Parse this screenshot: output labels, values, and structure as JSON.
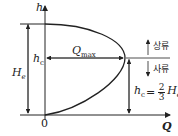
{
  "labels": {
    "h_axis": "h",
    "q_axis": "Q",
    "origin": "0",
    "hc_left": "h",
    "hc_left_sub": "c",
    "Hs": "H",
    "Hs_sub": "e",
    "qmax": "Q",
    "qmax_sub": "max",
    "upstream": "상류",
    "downstream": "사류",
    "formula_lhs": "h",
    "formula_lhs_sub": "c",
    "formula_eq": "=",
    "formula_num": "2",
    "formula_den": "3",
    "formula_rhs": "H",
    "formula_rhs_sub": "e"
  },
  "colors": {
    "line": "#222222"
  }
}
